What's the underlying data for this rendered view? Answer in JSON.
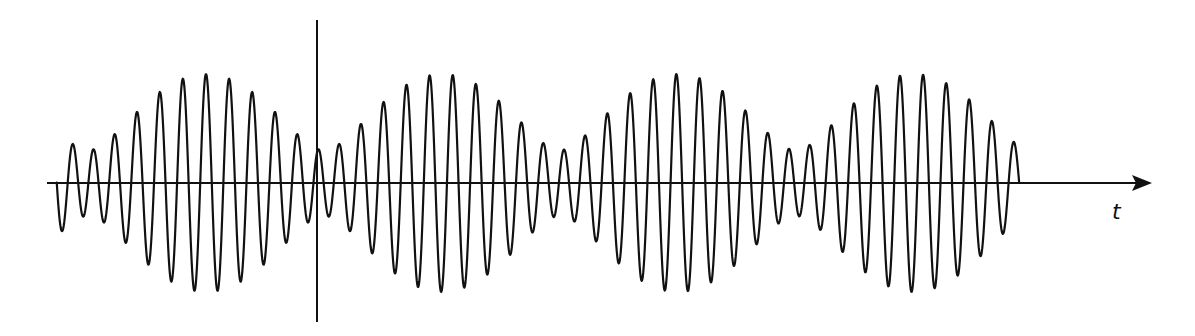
{
  "diagram": {
    "horizontal_axis": {
      "label": "t",
      "x_start": 47,
      "x_end": 1152,
      "y": 183,
      "arrow": true
    },
    "vertical_axis": {
      "x": 317,
      "y_top": 20,
      "y_bottom": 322,
      "arrow": false
    },
    "waveform": {
      "x_start": 66,
      "x_end": 1029,
      "baseline_y": 183,
      "components": [
        {
          "amplitude": 71,
          "period": 22.4
        },
        {
          "amplitude": 38,
          "period": 24.75
        }
      ],
      "phase_ref_x": 206,
      "initial_direction": "down",
      "envelope_max_px": 109,
      "envelope_min_px": 33,
      "envelope_peaks_x": [
        206,
        440,
        676,
        913
      ],
      "color": "#111111"
    }
  }
}
